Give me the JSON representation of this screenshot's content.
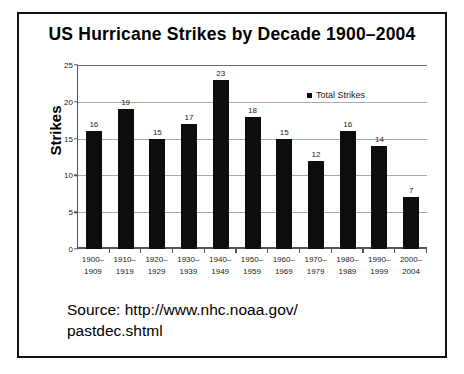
{
  "figure": {
    "title": "US Hurricane Strikes by Decade 1900–2004",
    "source_line_1": "Source: http://www.nhc.noaa.gov/",
    "source_line_2": "pastdec.shtml",
    "border_color": "#111111"
  },
  "legend": {
    "entries": [
      {
        "label": "Total Strikes",
        "color": "#0d0d0d",
        "marker": "square-marker"
      }
    ],
    "position": "top-right"
  },
  "chart_data": {
    "type": "bar",
    "title": "US Hurricane Strikes by Decade 1900–2004",
    "xlabel": "",
    "ylabel": "Strikes",
    "ylim": [
      0,
      25
    ],
    "yticks": [
      0,
      5,
      10,
      15,
      20,
      25
    ],
    "grid": true,
    "grid_axis": "y",
    "legend_position": "top-right",
    "bar_color": "#0d0d0d",
    "categories": [
      "1900–\n1909",
      "1910–\n1919",
      "1920–\n1929",
      "1930–\n1939",
      "1940–\n1949",
      "1950–\n1959",
      "1960–\n1969",
      "1970–\n1979",
      "1980–\n1989",
      "1990–\n1999",
      "2000–\n2004"
    ],
    "category_lines": [
      [
        "1900–",
        "1909"
      ],
      [
        "1910–",
        "1919"
      ],
      [
        "1920–",
        "1929"
      ],
      [
        "1930–",
        "1939"
      ],
      [
        "1940–",
        "1949"
      ],
      [
        "1950–",
        "1959"
      ],
      [
        "1960–",
        "1969"
      ],
      [
        "1970–",
        "1979"
      ],
      [
        "1980–",
        "1989"
      ],
      [
        "1990–",
        "1999"
      ],
      [
        "2000–",
        "2004"
      ]
    ],
    "series": [
      {
        "name": "Total Strikes",
        "values": [
          16,
          19,
          15,
          17,
          23,
          18,
          15,
          12,
          16,
          14,
          7
        ]
      }
    ]
  }
}
